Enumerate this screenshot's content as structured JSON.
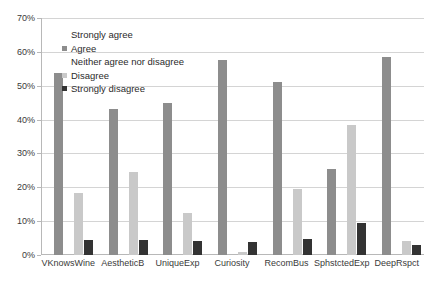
{
  "chart_data": {
    "type": "bar",
    "title": "",
    "xlabel": "",
    "ylabel": "",
    "ylim": [
      0,
      70
    ],
    "ytick_labels": [
      "0%",
      "10%",
      "20%",
      "30%",
      "40%",
      "50%",
      "60%",
      "70%"
    ],
    "ytick_values": [
      0,
      10,
      20,
      30,
      40,
      50,
      60,
      70
    ],
    "grid": true,
    "legend_position": "inside-top-left",
    "categories": [
      "VKnowsWine",
      "AestheticB",
      "UniqueExp",
      "Curiosity",
      "RecomBus",
      "SphstctedExp",
      "DeepRspct"
    ],
    "series": [
      {
        "name": "Strongly agree",
        "color": "#ffffff",
        "values": [
          0,
          0,
          0,
          0,
          0,
          0,
          0
        ]
      },
      {
        "name": "Agree",
        "color": "#8d8d8d",
        "values": [
          53.8,
          43.2,
          45.0,
          57.5,
          51.2,
          25.5,
          58.5
        ]
      },
      {
        "name": "Neither agree nor disagree",
        "color": "#595959",
        "values": [
          18.0,
          16.2,
          23.0,
          0.5,
          15.0,
          17.5,
          1.5
        ]
      },
      {
        "name": "Disagree",
        "color": "#c9c9c9",
        "values": [
          18.2,
          24.5,
          12.5,
          1.0,
          19.5,
          38.5,
          4.0
        ]
      },
      {
        "name": "Strongly disagree",
        "color": "#333333",
        "values": [
          4.5,
          4.5,
          4.0,
          3.8,
          4.8,
          9.5,
          3.0
        ]
      }
    ]
  },
  "legend": {
    "items": [
      {
        "label": "Strongly agree"
      },
      {
        "label": "Agree"
      },
      {
        "label": "Neither agree nor disagree"
      },
      {
        "label": "Disagree"
      },
      {
        "label": "Strongly disagree"
      }
    ]
  }
}
